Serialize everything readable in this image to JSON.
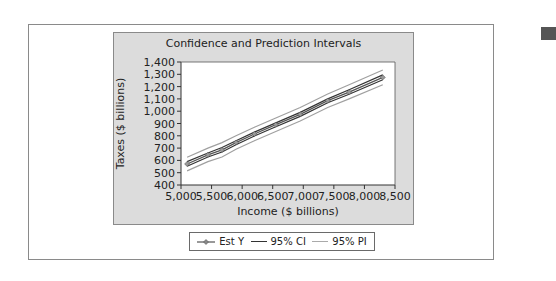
{
  "chart_data": {
    "type": "line",
    "title": "Confidence and Prediction Intervals",
    "xlabel": "Income ($ billions)",
    "ylabel": "Taxes ($ billions)",
    "xlim": [
      5000,
      8500
    ],
    "ylim": [
      400,
      1400
    ],
    "x_ticks": [
      "5,000",
      "5,500",
      "6,000",
      "6,500",
      "7,000",
      "7,500",
      "8,000",
      "8,500"
    ],
    "y_ticks": [
      "400",
      "500",
      "600",
      "700",
      "800",
      "900",
      "1,000",
      "1,100",
      "1,200",
      "1,300",
      "1,400"
    ],
    "x": [
      5100,
      5440,
      5670,
      5900,
      6200,
      6550,
      6950,
      7400,
      7750,
      8300
    ],
    "series": [
      {
        "name": "Est Y",
        "values": [
          571,
          645,
          685,
          745,
          815,
          890,
          975,
          1085,
          1155,
          1275
        ],
        "marker": "diamond",
        "color": "#555555"
      },
      {
        "name": "95% CI upper",
        "values": [
          590,
          660,
          705,
          760,
          830,
          905,
          990,
          1100,
          1175,
          1295
        ],
        "color": "#333333"
      },
      {
        "name": "95% CI lower",
        "values": [
          552,
          628,
          668,
          728,
          798,
          873,
          958,
          1068,
          1138,
          1255
        ],
        "color": "#333333"
      },
      {
        "name": "95% PI upper",
        "values": [
          625,
          700,
          745,
          800,
          870,
          945,
          1030,
          1140,
          1215,
          1335
        ],
        "color": "#a0a0a0"
      },
      {
        "name": "95% PI lower",
        "values": [
          515,
          590,
          628,
          690,
          760,
          835,
          920,
          1030,
          1100,
          1215
        ],
        "color": "#a0a0a0"
      }
    ],
    "legend": [
      "Est Y",
      "95% CI",
      "95% PI"
    ],
    "legend_position": "bottom",
    "grid": false
  },
  "title": "Confidence and Prediction Intervals",
  "xlabel": "Income ($ billions)",
  "ylabel": "Taxes ($ billions)",
  "legend": {
    "est": "Est Y",
    "ci": "95% CI",
    "pi": "95% PI"
  }
}
